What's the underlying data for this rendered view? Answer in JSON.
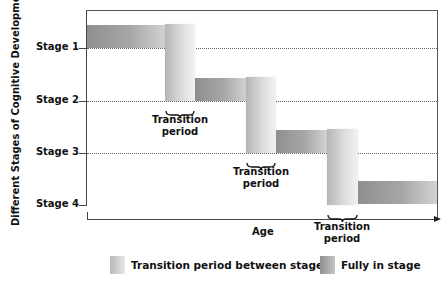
{
  "diagram": {
    "y_axis_label": "Different Stages of Cognitive Development",
    "x_axis_label": "Age",
    "stages": [
      {
        "label": "Stage 1"
      },
      {
        "label": "Stage 2"
      },
      {
        "label": "Stage 3"
      },
      {
        "label": "Stage 4"
      }
    ],
    "transitions": [
      {
        "line1": "Transition",
        "line2": "period"
      },
      {
        "line1": "Transition",
        "line2": "period"
      },
      {
        "line1": "Transition",
        "line2": "period"
      }
    ],
    "legend": {
      "transition": "Transition period between stages",
      "full": "Fully in stage"
    },
    "colors": {
      "full_stage_dark": "#8f8f8f",
      "transition_light": "#e0e0e0",
      "axis": "#444444"
    }
  }
}
